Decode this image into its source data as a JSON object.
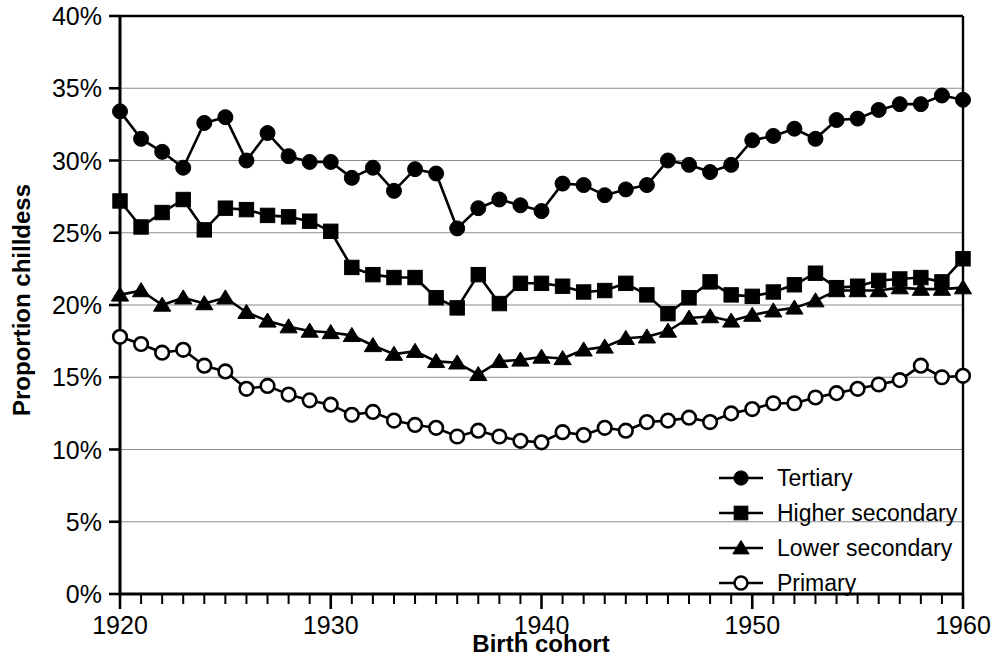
{
  "chart_data": {
    "type": "line",
    "title": "",
    "xlabel": "Birth cohort",
    "ylabel": "Proportion chilldess",
    "xlim": [
      1920,
      1960
    ],
    "ylim": [
      0,
      0.4
    ],
    "grid": true,
    "legend_position": "inside-bottom-right",
    "x_tick_labels": [
      "1920",
      "1930",
      "1940",
      "1950",
      "1960"
    ],
    "x_tick_values": [
      1920,
      1930,
      1940,
      1950,
      1960
    ],
    "x_minor_tick_step": 1,
    "y_tick_labels": [
      "0%",
      "5%",
      "10%",
      "15%",
      "20%",
      "25%",
      "30%",
      "35%",
      "40%"
    ],
    "y_tick_values": [
      0,
      5,
      10,
      15,
      20,
      25,
      30,
      35,
      40
    ],
    "x": [
      1920,
      1921,
      1922,
      1923,
      1924,
      1925,
      1926,
      1927,
      1928,
      1929,
      1930,
      1931,
      1932,
      1933,
      1934,
      1935,
      1936,
      1937,
      1938,
      1939,
      1940,
      1941,
      1942,
      1943,
      1944,
      1945,
      1946,
      1947,
      1948,
      1949,
      1950,
      1951,
      1952,
      1953,
      1954,
      1955,
      1956,
      1957,
      1958,
      1959,
      1960
    ],
    "series": [
      {
        "name": "Tertiary",
        "marker": "filled-circle",
        "color": "#000000",
        "values": [
          33.4,
          31.5,
          30.6,
          29.5,
          32.6,
          33.0,
          30.0,
          31.9,
          30.3,
          29.9,
          29.9,
          28.8,
          29.5,
          27.9,
          29.4,
          29.1,
          25.3,
          26.7,
          27.3,
          26.9,
          26.5,
          28.4,
          28.3,
          27.6,
          28.0,
          28.3,
          30.0,
          29.7,
          29.2,
          29.7,
          31.4,
          31.7,
          32.2,
          31.5,
          32.8,
          32.9,
          33.5,
          33.9,
          33.9,
          34.5,
          34.2
        ]
      },
      {
        "name": "Higher secondary",
        "marker": "filled-square",
        "color": "#000000",
        "values": [
          27.2,
          25.4,
          26.4,
          27.3,
          25.2,
          26.7,
          26.6,
          26.2,
          26.1,
          25.8,
          25.1,
          22.6,
          22.1,
          21.9,
          21.9,
          20.5,
          19.8,
          22.1,
          20.1,
          21.5,
          21.5,
          21.3,
          20.9,
          21.0,
          21.5,
          20.7,
          19.4,
          20.5,
          21.6,
          20.7,
          20.6,
          20.9,
          21.4,
          22.2,
          21.2,
          21.3,
          21.7,
          21.8,
          21.9,
          21.6,
          23.2
        ]
      },
      {
        "name": "Lower secondary",
        "marker": "filled-triangle",
        "color": "#000000",
        "values": [
          20.7,
          21.0,
          20.0,
          20.5,
          20.1,
          20.5,
          19.5,
          18.9,
          18.5,
          18.2,
          18.1,
          17.9,
          17.2,
          16.6,
          16.8,
          16.1,
          16.0,
          15.2,
          16.1,
          16.2,
          16.4,
          16.3,
          16.9,
          17.1,
          17.7,
          17.8,
          18.2,
          19.1,
          19.2,
          18.9,
          19.3,
          19.6,
          19.8,
          20.3,
          21.0,
          21.0,
          21.0,
          21.2,
          21.1,
          21.1,
          21.2
        ]
      },
      {
        "name": "Primary",
        "marker": "open-circle",
        "color": "#000000",
        "values": [
          17.8,
          17.3,
          16.7,
          16.9,
          15.8,
          15.4,
          14.2,
          14.4,
          13.8,
          13.4,
          13.1,
          12.4,
          12.6,
          12.0,
          11.7,
          11.5,
          10.9,
          11.3,
          10.9,
          10.6,
          10.5,
          11.2,
          11.0,
          11.5,
          11.3,
          11.9,
          12.0,
          12.2,
          11.9,
          12.5,
          12.8,
          13.2,
          13.2,
          13.6,
          13.9,
          14.2,
          14.5,
          14.8,
          15.8,
          15.0,
          15.1
        ]
      }
    ]
  },
  "legend": {
    "items": [
      {
        "label": "Tertiary",
        "marker": "filled-circle"
      },
      {
        "label": "Higher secondary",
        "marker": "filled-square"
      },
      {
        "label": "Lower secondary",
        "marker": "filled-triangle"
      },
      {
        "label": "Primary",
        "marker": "open-circle"
      }
    ]
  }
}
